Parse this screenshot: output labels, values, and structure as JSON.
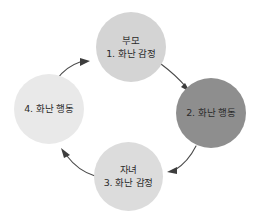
{
  "diagram": {
    "type": "cycle",
    "direction": "clockwise",
    "background_color": "#ffffff",
    "nodes": [
      {
        "id": "parent",
        "position": "top",
        "color": "#d4d4d4",
        "lines": [
          "부모",
          "1. 화난 감정"
        ]
      },
      {
        "id": "parent-behavior",
        "position": "right",
        "color": "#8e8e8e",
        "lines": [
          "2. 화난 행동"
        ]
      },
      {
        "id": "child",
        "position": "bottom",
        "color": "#dcdcdc",
        "lines": [
          "자녀",
          "3. 화난 감정"
        ]
      },
      {
        "id": "child-behavior",
        "position": "left",
        "color": "#e9e9e9",
        "lines": [
          "4. 화난 행동"
        ]
      }
    ],
    "arrows": [
      {
        "id": "arrow-top-right",
        "from": "parent",
        "to": "parent-behavior",
        "color": "#4a4a4a"
      },
      {
        "id": "arrow-bottom-right",
        "from": "parent-behavior",
        "to": "child",
        "color": "#4a4a4a"
      },
      {
        "id": "arrow-bottom-left",
        "from": "child",
        "to": "child-behavior",
        "color": "#4a4a4a"
      },
      {
        "id": "arrow-top-left",
        "from": "child-behavior",
        "to": "parent",
        "color": "#4a4a4a"
      }
    ]
  }
}
